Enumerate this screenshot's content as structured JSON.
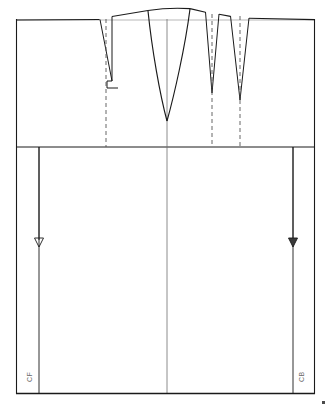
{
  "drawing": {
    "title": "Bodice block pattern draft with darts",
    "type": "technical-pattern-drawing",
    "stroke_color": "#1a1a1a",
    "light_stroke_color": "#8c8c8c",
    "dashed_color": "#555555",
    "background_color": "#ffffff",
    "label_color": "#6b6b6b"
  },
  "labels": {
    "center_front": "CF",
    "center_back": "CB"
  },
  "frame": {
    "left": 16,
    "right": 315,
    "top": 19,
    "bottom": 394,
    "waist_line_y": 147,
    "center_line_x": 167
  },
  "geometry": {
    "top_edge_points": "16,20 99,19 112,16 148,10 190,8 208,11 232,15 247,18 315,19",
    "neck_curve_points": "78,20 112,16 148,10 190,8 232,15 265,19",
    "top_baseline": {
      "x1": 16,
      "y1": 20,
      "x2": 315,
      "y2": 20
    }
  },
  "darts": [
    {
      "name": "left-shoulder-dart",
      "left_x": 100,
      "right_x": 112,
      "top_y": 19,
      "apex_y": 82,
      "center_x": 106,
      "dashed_from_y": 19,
      "dashed_to_y": 147,
      "has_notch_base": true
    },
    {
      "name": "center-front-dart",
      "left_x": 148,
      "right_x": 190,
      "top_y": 12,
      "apex_y": 121,
      "center_x": 167,
      "curved": true
    },
    {
      "name": "right-dart-inner",
      "left_x": 205,
      "right_x": 219,
      "top_y": 19,
      "apex_y": 93,
      "center_x": 212,
      "dashed_from_y": 19,
      "dashed_to_y": 147
    },
    {
      "name": "right-dart-outer",
      "left_x": 230,
      "right_x": 249,
      "top_y": 18,
      "apex_y": 100,
      "center_x": 240,
      "dashed_from_y": 18,
      "dashed_to_y": 147
    }
  ],
  "grainlines": [
    {
      "name": "front-grainline-arrow",
      "x": 39,
      "from_y": 147,
      "to_y": 245,
      "arrow": "down"
    },
    {
      "name": "back-grainline-arrow",
      "x": 293,
      "from_y": 147,
      "to_y": 245,
      "arrow": "down"
    }
  ],
  "side_seams": [
    {
      "name": "front-side-seam",
      "x": 39,
      "from_y": 147,
      "to_y": 394
    },
    {
      "name": "back-side-seam",
      "x": 293,
      "from_y": 147,
      "to_y": 394
    }
  ]
}
